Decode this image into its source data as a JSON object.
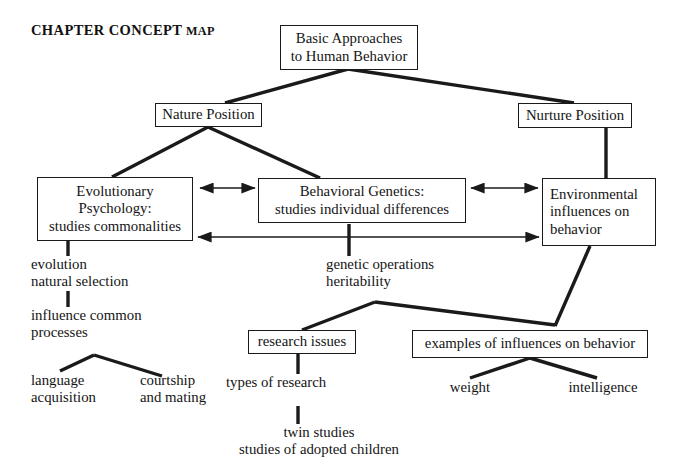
{
  "title": {
    "main": "CHAPTER CONCEPT",
    "small": "MAP"
  },
  "colors": {
    "ink": "#1a1a1a",
    "background": "#ffffff",
    "edge": "#1a1a1a"
  },
  "nodes": {
    "root": {
      "line1": "Basic Approaches",
      "line2": "to Human Behavior"
    },
    "nature": {
      "line1": "Nature Position"
    },
    "nurture": {
      "line1": "Nurture Position"
    },
    "evolutionary_psychology": {
      "line1": "Evolutionary",
      "line2": "Psychology:",
      "line3": "studies commonalities"
    },
    "behavioral_genetics": {
      "line1": "Behavioral Genetics:",
      "line2": "studies individual differences"
    },
    "environmental_influences": {
      "line1": "Environmental",
      "line2": "influences on",
      "line3": "behavior"
    },
    "evolution_terms": {
      "line1": "evolution",
      "line2": "natural selection"
    },
    "influence_processes": {
      "line1": "influence common",
      "line2": "processes"
    },
    "language_acquisition": {
      "line1": "language",
      "line2": "acquisition"
    },
    "courtship_mating": {
      "line1": "courtship",
      "line2": "and mating"
    },
    "genetic_terms": {
      "line1": "genetic operations",
      "line2": "heritability"
    },
    "research_issues": {
      "line1": "research issues"
    },
    "types_of_research": {
      "line1": "types of research"
    },
    "twin_studies": {
      "line1": "twin studies",
      "line2": "studies of adopted children"
    },
    "examples_of_influences": {
      "line1": "examples of influences on behavior"
    },
    "weight": {
      "line1": "weight"
    },
    "intelligence": {
      "line1": "intelligence"
    }
  },
  "edges": [
    {
      "name": "root-to-nature",
      "from": "root",
      "to": "nature",
      "style": "line"
    },
    {
      "name": "root-to-nurture",
      "from": "root",
      "to": "nurture",
      "style": "line"
    },
    {
      "name": "nature-to-evolutionary-psychology",
      "from": "nature",
      "to": "evolutionary_psychology",
      "style": "line"
    },
    {
      "name": "nature-to-behavioral-genetics",
      "from": "nature",
      "to": "behavioral_genetics",
      "style": "line"
    },
    {
      "name": "nurture-to-environmental-influences",
      "from": "nurture",
      "to": "environmental_influences",
      "style": "line"
    },
    {
      "name": "evolutionary-psychology-to-behavioral-genetics",
      "from": "evolutionary_psychology",
      "to": "behavioral_genetics",
      "style": "double-arrow"
    },
    {
      "name": "behavioral-genetics-to-environmental-influences",
      "from": "behavioral_genetics",
      "to": "environmental_influences",
      "style": "double-arrow"
    },
    {
      "name": "evolutionary-psychology-to-environmental-influences",
      "from": "evolutionary_psychology",
      "to": "environmental_influences",
      "style": "double-arrow"
    },
    {
      "name": "evolutionary-psychology-to-evolution-terms",
      "from": "evolutionary_psychology",
      "to": "evolution_terms",
      "style": "line"
    },
    {
      "name": "evolution-terms-to-influence-processes",
      "from": "evolution_terms",
      "to": "influence_processes",
      "style": "line"
    },
    {
      "name": "influence-processes-to-language-acquisition",
      "from": "influence_processes",
      "to": "language_acquisition",
      "style": "line"
    },
    {
      "name": "influence-processes-to-courtship-mating",
      "from": "influence_processes",
      "to": "courtship_mating",
      "style": "line"
    },
    {
      "name": "behavioral-genetics-to-genetic-terms",
      "from": "behavioral_genetics",
      "to": "genetic_terms",
      "style": "line"
    },
    {
      "name": "genetic-terms-to-research-issues",
      "from": "genetic_terms",
      "to": "research_issues",
      "style": "line"
    },
    {
      "name": "genetic-terms-to-examples-of-influences",
      "from": "genetic_terms",
      "to": "examples_of_influences",
      "style": "line"
    },
    {
      "name": "research-issues-to-types-of-research",
      "from": "research_issues",
      "to": "types_of_research",
      "style": "line"
    },
    {
      "name": "types-of-research-to-twin-studies",
      "from": "types_of_research",
      "to": "twin_studies",
      "style": "line"
    },
    {
      "name": "environmental-influences-to-examples-of-influences",
      "from": "environmental_influences",
      "to": "examples_of_influences",
      "style": "line"
    },
    {
      "name": "examples-of-influences-to-weight",
      "from": "examples_of_influences",
      "to": "weight",
      "style": "line"
    },
    {
      "name": "examples-of-influences-to-intelligence",
      "from": "examples_of_influences",
      "to": "intelligence",
      "style": "line"
    }
  ]
}
